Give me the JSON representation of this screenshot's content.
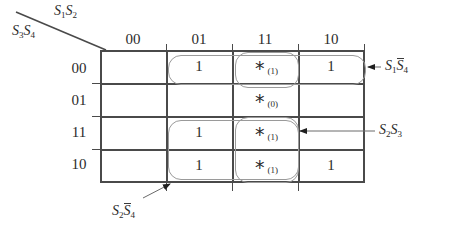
{
  "diagram": {
    "type": "karnaugh-map",
    "column_variable_label": "S1S2",
    "row_variable_label": "S3S4",
    "column_headers": [
      "00",
      "01",
      "11",
      "10"
    ],
    "row_headers": [
      "00",
      "01",
      "11",
      "10"
    ],
    "cells": [
      [
        {
          "text": "",
          "sub": ""
        },
        {
          "text": "1",
          "sub": ""
        },
        {
          "text": "*",
          "sub": "(1)"
        },
        {
          "text": "1",
          "sub": ""
        }
      ],
      [
        {
          "text": "",
          "sub": ""
        },
        {
          "text": "",
          "sub": ""
        },
        {
          "text": "*",
          "sub": "(0)"
        },
        {
          "text": "",
          "sub": ""
        }
      ],
      [
        {
          "text": "",
          "sub": ""
        },
        {
          "text": "1",
          "sub": ""
        },
        {
          "text": "*",
          "sub": "(1)"
        },
        {
          "text": "",
          "sub": ""
        }
      ],
      [
        {
          "text": "",
          "sub": ""
        },
        {
          "text": "1",
          "sub": ""
        },
        {
          "text": "*",
          "sub": "(1)"
        },
        {
          "text": "1",
          "sub": ""
        }
      ]
    ],
    "groups": [
      {
        "name": "S1S4bar",
        "label_plain": "S1 S4bar",
        "covers": "row 00, columns 01-10"
      },
      {
        "name": "S2S3",
        "label_plain": "S2 S3",
        "covers": "column 11, rows 11-10"
      },
      {
        "name": "S2S4bar",
        "label_plain": "S2 S4bar",
        "covers": "rows 11-10, columns 01-11"
      }
    ],
    "annotations": [
      {
        "name": "annotation-s1s4bar",
        "text": "S1S4"
      },
      {
        "name": "annotation-s2s3",
        "text": "S2S3"
      },
      {
        "name": "annotation-s2s4bar",
        "text": "S2S4"
      }
    ],
    "colors": {
      "grid_line": "#4a4a4a",
      "group_outline": "#9a9a9a",
      "text": "#2b2b2b",
      "background": "#ffffff"
    }
  }
}
